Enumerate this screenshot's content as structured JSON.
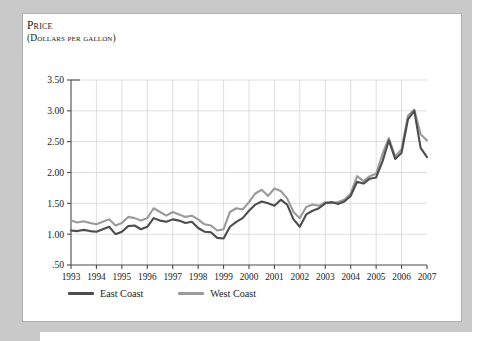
{
  "figure": {
    "axis_title": "Price",
    "axis_subtitle": "(Dollars per gallon)"
  },
  "legend": {
    "position": "bottom",
    "entries": [
      {
        "label": "East Coast",
        "color": "#4d4d4d",
        "name": "legend-east-coast"
      },
      {
        "label": "West Coast",
        "color": "#9a9a9a",
        "name": "legend-west-coast"
      }
    ]
  },
  "chart_data": {
    "type": "line",
    "title": "Price",
    "subtitle": "(Dollars per gallon)",
    "xlabel": "",
    "ylabel": "Price (dollars per gallon)",
    "xlim": [
      1993,
      2007
    ],
    "ylim": [
      0.5,
      3.5
    ],
    "yticks": [
      0.5,
      1.0,
      1.5,
      2.0,
      2.5,
      3.0,
      3.5
    ],
    "ytick_labels": [
      ".50",
      "1.00",
      "1.50",
      "2.00",
      "2.50",
      "3.00",
      "3.50"
    ],
    "xticks": [
      1993,
      1994,
      1995,
      1996,
      1997,
      1998,
      1999,
      2000,
      2001,
      2002,
      2003,
      2004,
      2005,
      2006,
      2007
    ],
    "xtick_labels": [
      "1993",
      "1994",
      "1995",
      "1996",
      "1997",
      "1998",
      "1999",
      "2000",
      "2001",
      "2002",
      "2003",
      "2004",
      "2005",
      "2006",
      "2007"
    ],
    "grid": true,
    "legend_position": "bottom",
    "x": [
      1993.0,
      1993.25,
      1993.5,
      1993.75,
      1994.0,
      1994.25,
      1994.5,
      1994.75,
      1995.0,
      1995.25,
      1995.5,
      1995.75,
      1996.0,
      1996.25,
      1996.5,
      1996.75,
      1997.0,
      1997.25,
      1997.5,
      1997.75,
      1998.0,
      1998.25,
      1998.5,
      1998.75,
      1999.0,
      1999.25,
      1999.5,
      1999.75,
      2000.0,
      2000.25,
      2000.5,
      2000.75,
      2001.0,
      2001.25,
      2001.5,
      2001.75,
      2002.0,
      2002.25,
      2002.5,
      2002.75,
      2003.0,
      2003.25,
      2003.5,
      2003.75,
      2004.0,
      2004.25,
      2004.5,
      2004.75,
      2005.0,
      2005.25,
      2005.5,
      2005.75,
      2006.0,
      2006.25,
      2006.5,
      2006.75,
      2007.0
    ],
    "series": [
      {
        "name": "East Coast",
        "color": "#4d4d4d",
        "values": [
          1.06,
          1.05,
          1.07,
          1.05,
          1.04,
          1.08,
          1.12,
          1.0,
          1.04,
          1.13,
          1.14,
          1.08,
          1.12,
          1.26,
          1.22,
          1.2,
          1.24,
          1.22,
          1.18,
          1.2,
          1.1,
          1.04,
          1.03,
          0.94,
          0.93,
          1.12,
          1.2,
          1.26,
          1.38,
          1.48,
          1.53,
          1.5,
          1.46,
          1.56,
          1.48,
          1.24,
          1.12,
          1.32,
          1.38,
          1.42,
          1.5,
          1.52,
          1.49,
          1.53,
          1.62,
          1.85,
          1.82,
          1.9,
          1.92,
          2.18,
          2.52,
          2.22,
          2.32,
          2.86,
          3.0,
          2.4,
          2.25
        ]
      },
      {
        "name": "West Coast",
        "color": "#9a9a9a",
        "values": [
          1.22,
          1.19,
          1.21,
          1.18,
          1.16,
          1.2,
          1.24,
          1.14,
          1.18,
          1.28,
          1.26,
          1.22,
          1.26,
          1.42,
          1.36,
          1.3,
          1.36,
          1.32,
          1.28,
          1.3,
          1.24,
          1.16,
          1.14,
          1.06,
          1.08,
          1.36,
          1.42,
          1.4,
          1.52,
          1.66,
          1.72,
          1.62,
          1.74,
          1.7,
          1.58,
          1.36,
          1.26,
          1.44,
          1.48,
          1.46,
          1.52,
          1.5,
          1.52,
          1.56,
          1.66,
          1.94,
          1.86,
          1.94,
          1.98,
          2.3,
          2.56,
          2.26,
          2.38,
          2.92,
          3.02,
          2.62,
          2.52
        ]
      }
    ]
  }
}
